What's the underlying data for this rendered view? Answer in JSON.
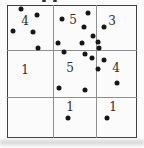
{
  "figure": {
    "title_semantic": "quadrat-grid-with-dot-counts",
    "background_color": "#fbfbfb",
    "border_color": "#3f3f3f",
    "gridline_color": "#8f8f8f",
    "dot_color": "#161616",
    "text_color": "#2e2e2e",
    "grid": {
      "x": 7,
      "y": 5,
      "width": 130,
      "height": 133,
      "v_lines": [
        53,
        96
      ],
      "h_lines": [
        50,
        97
      ]
    },
    "dot_diameter": 5,
    "cells": [
      {
        "name": "top-left",
        "count": "4",
        "label_x": 25,
        "label_y": 21
      },
      {
        "name": "top-middle",
        "count": "5",
        "label_x": 73,
        "label_y": 20
      },
      {
        "name": "top-right",
        "count": "3",
        "label_x": 112,
        "label_y": 21
      },
      {
        "name": "middle-left",
        "count": "1",
        "label_x": 25,
        "label_y": 70
      },
      {
        "name": "middle-middle",
        "count": "5",
        "label_x": 70,
        "label_y": 68
      },
      {
        "name": "middle-right",
        "count": "4",
        "label_x": 116,
        "label_y": 68
      },
      {
        "name": "bottom-left",
        "count": "",
        "label_x": 25,
        "label_y": 117
      },
      {
        "name": "bottom-middle",
        "count": "1",
        "label_x": 70,
        "label_y": 107
      },
      {
        "name": "bottom-right",
        "count": "1",
        "label_x": 113,
        "label_y": 107
      }
    ],
    "dots": [
      [
        21,
        9
      ],
      [
        37,
        15
      ],
      [
        13,
        31
      ],
      [
        33,
        32
      ],
      [
        62,
        19
      ],
      [
        88,
        13
      ],
      [
        84,
        27
      ],
      [
        58,
        43
      ],
      [
        82,
        43
      ],
      [
        104,
        27
      ],
      [
        93,
        36
      ],
      [
        98,
        42
      ],
      [
        38,
        48
      ],
      [
        64,
        52
      ],
      [
        85,
        54
      ],
      [
        92,
        58
      ],
      [
        59,
        88
      ],
      [
        85,
        90
      ],
      [
        99,
        48
      ],
      [
        104,
        60
      ],
      [
        98,
        69
      ],
      [
        117,
        83
      ],
      [
        68,
        118
      ],
      [
        107,
        118
      ]
    ],
    "edge_marks": [
      [
        42,
        0
      ],
      [
        53,
        0
      ]
    ],
    "scan_shadow_y": 140
  },
  "chart_data": {
    "type": "table",
    "rows": [
      [
        "4",
        "5",
        "3"
      ],
      [
        "1",
        "5",
        "4"
      ],
      [
        "",
        "1",
        "1"
      ]
    ],
    "total_dots": 24
  }
}
